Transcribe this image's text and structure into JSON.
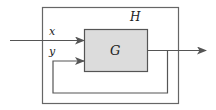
{
  "diagram": {
    "outer_block": {
      "label": "H"
    },
    "inner_block": {
      "label": "G",
      "fill": "#dcdcdc"
    },
    "inputs": [
      {
        "label": "x"
      },
      {
        "label": "y"
      }
    ],
    "line_color": "#555555"
  }
}
